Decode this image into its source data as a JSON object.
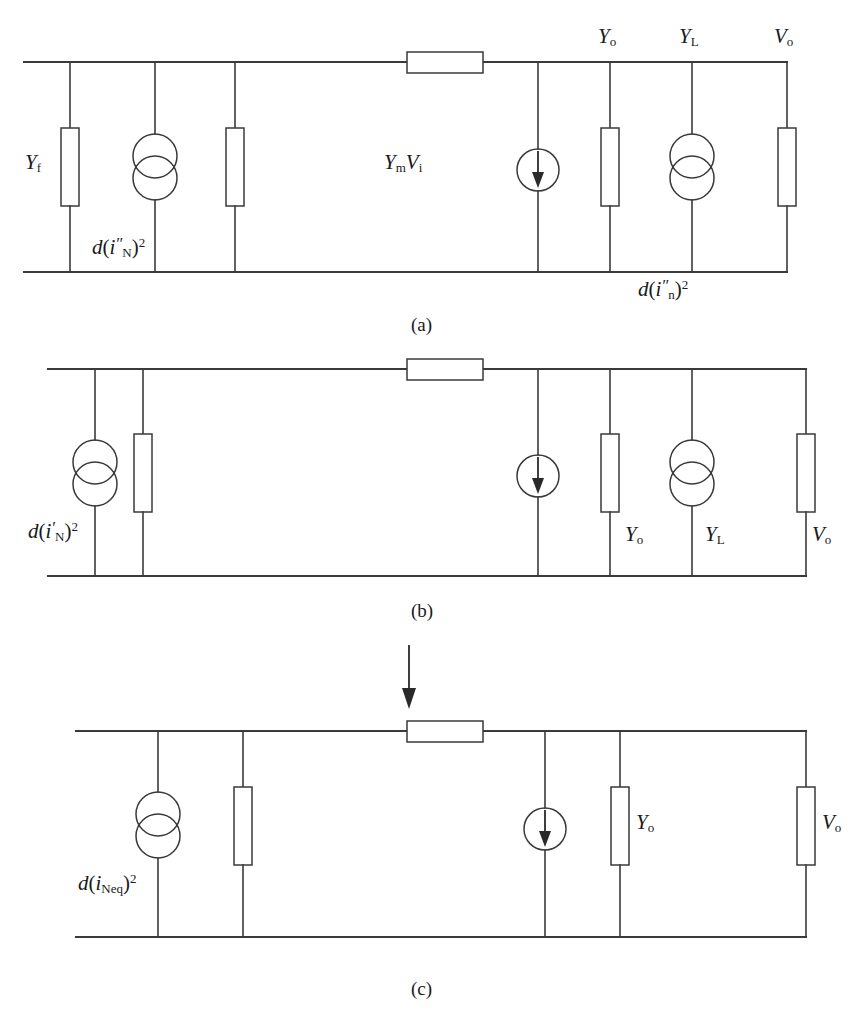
{
  "figure": {
    "ink_color": "#3a3a3a",
    "background_color": "#ffffff",
    "panel_count": 3
  },
  "panels": [
    {
      "id": "a",
      "caption": "(a)",
      "labels": {
        "yf": "Y",
        "yf_sub": "f",
        "noise_source_left_d": "d",
        "noise_source_left_open": "(",
        "noise_source_left_i": "i",
        "noise_source_left_prime": "″",
        "noise_source_left_sub": "N",
        "noise_source_left_close": ")",
        "noise_source_left_exp": "2",
        "dependent_source_y": "Y",
        "dependent_source_y_sub": "m",
        "dependent_source_v": "V",
        "dependent_source_v_sub": "i",
        "yo": "Y",
        "yo_sub": "o",
        "yl": "Y",
        "yl_sub": "L",
        "vo": "V",
        "vo_sub": "o",
        "noise_source_right_d": "d",
        "noise_source_right_open": "(",
        "noise_source_right_i": "i",
        "noise_source_right_prime": "″",
        "noise_source_right_sub": "n",
        "noise_source_right_close": ")",
        "noise_source_right_exp": "2"
      }
    },
    {
      "id": "b",
      "caption": "(b)",
      "labels": {
        "noise_source_left_d": "d",
        "noise_source_left_open": "(",
        "noise_source_left_i": "i",
        "noise_source_left_prime": "′",
        "noise_source_left_sub": "N",
        "noise_source_left_close": ")",
        "noise_source_left_exp": "2",
        "yo": "Y",
        "yo_sub": "o",
        "yl": "Y",
        "yl_sub": "L",
        "vo": "V",
        "vo_sub": "o"
      }
    },
    {
      "id": "c",
      "caption": "(c)",
      "labels": {
        "noise_source_left_d": "d",
        "noise_source_left_open": "(",
        "noise_source_left_i": "i",
        "noise_source_left_sub": "Neq",
        "noise_source_left_close": ")",
        "noise_source_left_exp": "2",
        "yo": "Y",
        "yo_sub": "o",
        "vo": "V",
        "vo_sub": "o"
      },
      "annotation": {
        "arrow_icon": "down-arrow-icon"
      }
    }
  ],
  "symbols": {
    "resistor": "rectangle-box",
    "noise_current_source": "two-overlapping-circles",
    "dependent_current_source": "circle-with-down-arrow",
    "transformation_arrow": "down-arrow"
  }
}
